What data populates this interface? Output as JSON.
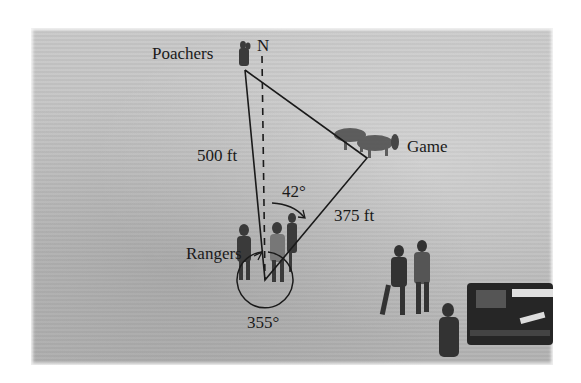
{
  "figure": {
    "labels": {
      "north": "N",
      "poachers": "Poachers",
      "game": "Game",
      "rangers": "Rangers",
      "side_rangers_poachers": "500 ft",
      "side_rangers_game": "375 ft",
      "angle_game_bearing": "42°",
      "angle_poachers_bearing": "355°"
    },
    "colors": {
      "line": "#1a1a1a",
      "photo_background": "#c2c2c2"
    }
  }
}
